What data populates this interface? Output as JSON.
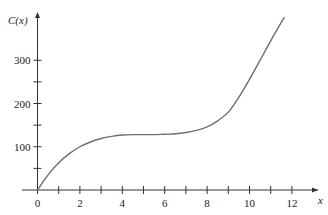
{
  "chart_data": {
    "type": "line",
    "title": "",
    "xlabel": "x",
    "ylabel": "C(x)",
    "xlim": [
      0,
      12.8
    ],
    "ylim": [
      0,
      400
    ],
    "x_ticks": [
      0,
      1,
      2,
      3,
      4,
      5,
      6,
      7,
      8,
      9,
      10,
      11,
      12
    ],
    "x_tick_labels": [
      "0",
      "2",
      "4",
      "6",
      "8",
      "10",
      "12"
    ],
    "x_tick_label_values": [
      0,
      2,
      4,
      6,
      8,
      10,
      12
    ],
    "y_ticks": [
      50,
      100,
      150,
      200,
      250,
      300
    ],
    "y_tick_labels": [
      "100",
      "200",
      "300"
    ],
    "y_tick_label_values": [
      100,
      200,
      300
    ],
    "grid": false,
    "legend": null,
    "series": [
      {
        "name": "C(x)",
        "color": "#6e6e6e",
        "x": [
          0,
          0.5,
          1,
          1.5,
          2,
          2.5,
          3,
          3.5,
          4,
          4.5,
          5,
          5.5,
          6,
          6.5,
          7,
          7.5,
          8,
          8.5,
          9,
          9.5,
          10,
          10.5,
          11,
          11.65
        ],
        "y": [
          0,
          35,
          63,
          84,
          100,
          111,
          119,
          124,
          127,
          128,
          128,
          128,
          129,
          130,
          133,
          138,
          146,
          160,
          180,
          215,
          256,
          300,
          345,
          400
        ]
      }
    ]
  },
  "axes": {
    "y_label": "C(x)",
    "x_label": "x"
  }
}
